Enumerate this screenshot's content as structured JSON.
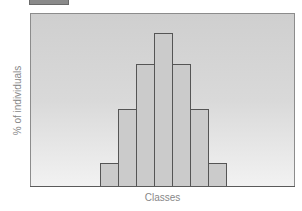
{
  "chart_data": {
    "type": "bar",
    "title": "",
    "xlabel": "Classes",
    "ylabel": "% of individuals",
    "categories": [
      "1",
      "2",
      "3",
      "4",
      "5",
      "6",
      "7"
    ],
    "values": [
      3,
      10,
      16,
      20,
      16,
      10,
      3
    ],
    "ylim": [
      0,
      22.6
    ],
    "grid": false,
    "legend": {
      "position": "top-left",
      "entries": [
        ""
      ]
    },
    "colors": {
      "bar_fill": "#cbcbcb",
      "bar_edge": "#555555",
      "background_top": "#cfcfcf",
      "background_bottom": "#f2f2f2"
    }
  }
}
